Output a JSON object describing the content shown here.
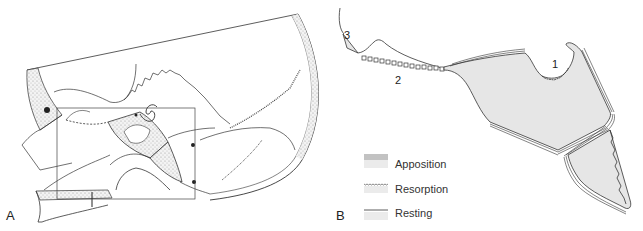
{
  "figure": {
    "panels": [
      {
        "id": "A",
        "label": "A",
        "description": "Lateral skull drawing with rectangle marking enlarged region"
      },
      {
        "id": "B",
        "label": "B",
        "description": "Enlarged schematic of bone surfaces showing remodeling"
      }
    ],
    "panel_b": {
      "region_labels": [
        {
          "id": "1",
          "text": "1"
        },
        {
          "id": "2",
          "text": "2"
        },
        {
          "id": "3",
          "text": "3"
        }
      ],
      "legend": [
        {
          "label": "Apposition",
          "swatch": "triple-line"
        },
        {
          "label": "Resorption",
          "swatch": "wavy-line"
        },
        {
          "label": "Resting",
          "swatch": "single-line"
        }
      ]
    },
    "colors": {
      "line": "#333333",
      "bone_fill": "#e6e6e6",
      "stipple": "#bdbdbd",
      "background": "#ffffff"
    }
  }
}
